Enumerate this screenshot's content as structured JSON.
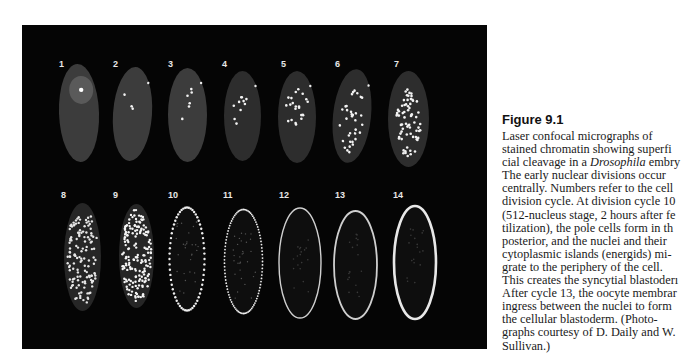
{
  "figure": {
    "panel_background": "#050505",
    "embryos": [
      {
        "label": "1",
        "cycle": 1,
        "row": 1,
        "stage": "single central nucleus"
      },
      {
        "label": "2",
        "cycle": 2,
        "row": 1,
        "stage": "few central nuclei"
      },
      {
        "label": "3",
        "cycle": 3,
        "row": 1,
        "stage": "few central nuclei"
      },
      {
        "label": "4",
        "cycle": 4,
        "row": 1,
        "stage": "central nuclei"
      },
      {
        "label": "5",
        "cycle": 5,
        "row": 1,
        "stage": "central nuclei"
      },
      {
        "label": "6",
        "cycle": 6,
        "row": 1,
        "stage": "central nuclei"
      },
      {
        "label": "7",
        "cycle": 7,
        "row": 1,
        "stage": "many central nuclei"
      },
      {
        "label": "8",
        "cycle": 8,
        "row": 2,
        "stage": "dense nuclei"
      },
      {
        "label": "9",
        "cycle": 9,
        "row": 2,
        "stage": "dense nuclei"
      },
      {
        "label": "10",
        "cycle": 10,
        "row": 2,
        "stage": "nuclei at periphery"
      },
      {
        "label": "11",
        "cycle": 11,
        "row": 2,
        "stage": "peripheral nuclei"
      },
      {
        "label": "12",
        "cycle": 12,
        "row": 2,
        "stage": "syncytial blastoderm"
      },
      {
        "label": "13",
        "cycle": 13,
        "row": 2,
        "stage": "syncytial blastoderm"
      },
      {
        "label": "14",
        "cycle": 14,
        "row": 2,
        "stage": "cellular blastoderm"
      }
    ]
  },
  "caption": {
    "title": "Figure 9.1",
    "lines": [
      {
        "pre": "Laser confocal micrographs of",
        "em": "",
        "post": ""
      },
      {
        "pre": "stained chromatin showing superfi",
        "em": "",
        "post": ""
      },
      {
        "pre": "cial cleavage in a ",
        "em": "Drosophila",
        "post": " embry"
      },
      {
        "pre": "The early nuclear divisions occur",
        "em": "",
        "post": ""
      },
      {
        "pre": "centrally. Numbers refer to the cell",
        "em": "",
        "post": ""
      },
      {
        "pre": "division cycle. At division cycle 10",
        "em": "",
        "post": ""
      },
      {
        "pre": "(512-nucleus stage, 2 hours after fe",
        "em": "",
        "post": ""
      },
      {
        "pre": "tilization), the pole cells form in th",
        "em": "",
        "post": ""
      },
      {
        "pre": "posterior, and the nuclei and their",
        "em": "",
        "post": ""
      },
      {
        "pre": "cytoplasmic islands (energids) mi-",
        "em": "",
        "post": ""
      },
      {
        "pre": "grate to the periphery of the cell.",
        "em": "",
        "post": ""
      },
      {
        "pre": "This creates the syncytial blastoderı",
        "em": "",
        "post": ""
      },
      {
        "pre": "After cycle 13, the oocyte membrar",
        "em": "",
        "post": ""
      },
      {
        "pre": "ingress between the nuclei to form",
        "em": "",
        "post": ""
      },
      {
        "pre": "the cellular blastoderm. (Photo-",
        "em": "",
        "post": ""
      },
      {
        "pre": "graphs courtesy of D. Daily and W.",
        "em": "",
        "post": ""
      },
      {
        "pre": "Sullivan.)",
        "em": "",
        "post": ""
      }
    ]
  }
}
